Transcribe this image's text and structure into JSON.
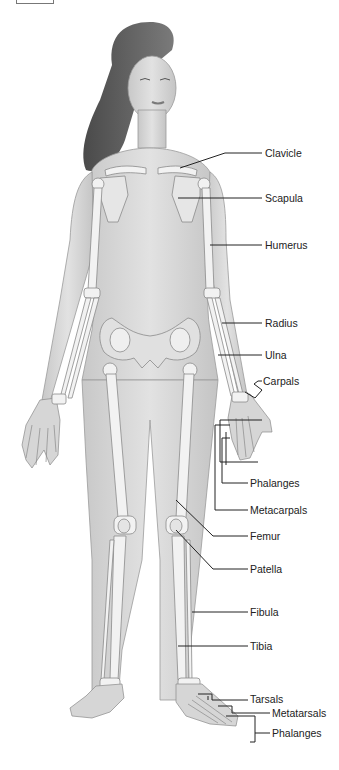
{
  "figure": {
    "labels": [
      {
        "id": "clavicle",
        "text": "Clavicle",
        "x": 265,
        "y": 147
      },
      {
        "id": "scapula",
        "text": "Scapula",
        "x": 265,
        "y": 192
      },
      {
        "id": "humerus",
        "text": "Humerus",
        "x": 265,
        "y": 239
      },
      {
        "id": "radius",
        "text": "Radius",
        "x": 265,
        "y": 317
      },
      {
        "id": "ulna",
        "text": "Ulna",
        "x": 265,
        "y": 349
      },
      {
        "id": "carpals",
        "text": "Carpals",
        "x": 263,
        "y": 375
      },
      {
        "id": "phalanges-hand",
        "text": "Phalanges",
        "x": 250,
        "y": 477
      },
      {
        "id": "metacarpals",
        "text": "Metacarpals",
        "x": 250,
        "y": 504
      },
      {
        "id": "femur",
        "text": "Femur",
        "x": 250,
        "y": 530
      },
      {
        "id": "patella",
        "text": "Patella",
        "x": 250,
        "y": 563
      },
      {
        "id": "fibula",
        "text": "Fibula",
        "x": 250,
        "y": 606
      },
      {
        "id": "tibia",
        "text": "Tibia",
        "x": 250,
        "y": 640
      },
      {
        "id": "tarsals",
        "text": "Tarsals",
        "x": 250,
        "y": 693
      },
      {
        "id": "metatarsals",
        "text": "Metatarsals",
        "x": 272,
        "y": 707
      },
      {
        "id": "phalanges-foot",
        "text": "Phalanges",
        "x": 272,
        "y": 727
      }
    ]
  },
  "colors": {
    "skin": "#d9d9d9",
    "skin_shade": "#bdbdbd",
    "bone": "#f2f2f2",
    "bone_outline": "#8a8a8a",
    "hair": "#5a5a5a",
    "leader": "#222222"
  }
}
